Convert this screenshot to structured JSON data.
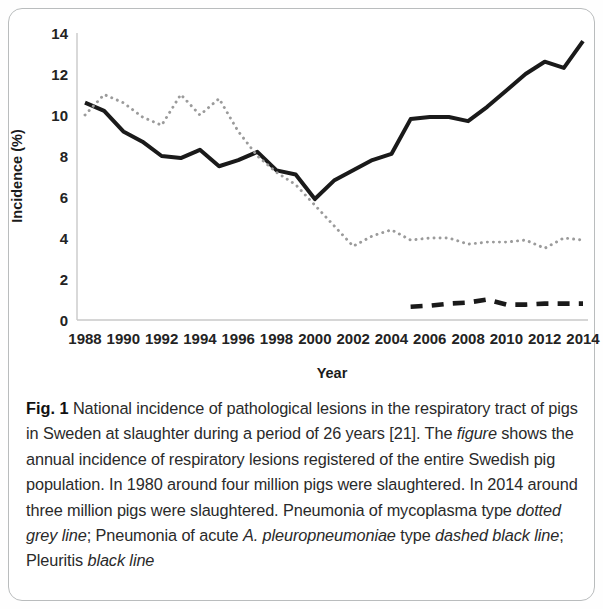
{
  "figure": {
    "label": "Fig. 1",
    "caption_segments": [
      {
        "text": "Fig. 1",
        "style": "bold"
      },
      {
        "text": " National incidence of pathological lesions in the respiratory tract of pigs in Sweden at slaughter during a period of 26 years [21]. The ",
        "style": "normal"
      },
      {
        "text": "figure",
        "style": "italic"
      },
      {
        "text": " shows the annual incidence of respiratory lesions registered of the entire Swedish pig population. In 1980 around four million pigs were slaughtered. In 2014 around three million pigs were slaughtered. Pneumonia of mycoplasma type ",
        "style": "normal"
      },
      {
        "text": "dotted grey line",
        "style": "italic"
      },
      {
        "text": "; Pneumonia of acute ",
        "style": "normal"
      },
      {
        "text": "A. pleuropneumoniae",
        "style": "italic"
      },
      {
        "text": " type ",
        "style": "normal"
      },
      {
        "text": "dashed black line",
        "style": "italic"
      },
      {
        "text": "; Pleuritis ",
        "style": "normal"
      },
      {
        "text": "black line",
        "style": "italic"
      }
    ],
    "caption_plain": "Fig. 1 National incidence of pathological lesions in the respiratory tract of pigs in Sweden at slaughter during a period of 26 years [21]. The figure shows the annual incidence of respiratory lesions registered of the entire Swedish pig population. In 1980 around four million pigs were slaughtered. In 2014 around three million pigs were slaughtered. Pneumonia of mycoplasma type dotted grey line; Pneumonia of acute A. pleuropneumoniae type dashed black line; Pleuritis black line"
  },
  "chart_data": {
    "type": "line",
    "title": "",
    "xlabel": "Year",
    "ylabel": "Incidence (%)",
    "xlim": [
      1988,
      2014
    ],
    "ylim": [
      0,
      14
    ],
    "ytick_labels": [
      "0",
      "2",
      "4",
      "6",
      "8",
      "10",
      "12",
      "14"
    ],
    "yticks": [
      0,
      2,
      4,
      6,
      8,
      10,
      12,
      14
    ],
    "xtick_labels": [
      "1988",
      "1990",
      "1992",
      "1994",
      "1996",
      "1998",
      "2000",
      "2002",
      "2004",
      "2006",
      "2008",
      "2010",
      "2012",
      "2014"
    ],
    "xticks": [
      1988,
      1990,
      1992,
      1994,
      1996,
      1998,
      2000,
      2002,
      2004,
      2006,
      2008,
      2010,
      2012,
      2014
    ],
    "grid": false,
    "legend_position": "none",
    "x": [
      1988,
      1989,
      1990,
      1991,
      1992,
      1993,
      1994,
      1995,
      1996,
      1997,
      1998,
      1999,
      2000,
      2001,
      2002,
      2003,
      2004,
      2005,
      2006,
      2007,
      2008,
      2009,
      2010,
      2011,
      2012,
      2013,
      2014
    ],
    "series": [
      {
        "name": "Pleuritis",
        "style": "solid",
        "color": "#1a1a1a",
        "values": [
          10.6,
          10.2,
          9.2,
          8.7,
          8.0,
          7.9,
          8.3,
          7.5,
          7.8,
          8.2,
          7.3,
          7.1,
          5.9,
          6.8,
          7.3,
          7.8,
          8.1,
          9.8,
          9.9,
          9.9,
          9.7,
          10.4,
          11.2,
          12.0,
          12.6,
          12.3,
          13.6
        ]
      },
      {
        "name": "Pneumonia of mycoplasma type",
        "style": "dotted",
        "color": "#9b9b9b",
        "values": [
          10.0,
          11.0,
          10.6,
          9.9,
          9.5,
          11.0,
          10.0,
          10.8,
          9.2,
          8.0,
          7.2,
          6.6,
          5.6,
          4.6,
          3.6,
          4.1,
          4.4,
          3.9,
          4.0,
          4.0,
          3.7,
          3.8,
          3.8,
          3.9,
          3.5,
          4.0,
          3.9
        ]
      },
      {
        "name": "Pneumonia of acute A. pleuropneumoniae type",
        "style": "dashed",
        "color": "#1a1a1a",
        "values": [
          null,
          null,
          null,
          null,
          null,
          null,
          null,
          null,
          null,
          null,
          null,
          null,
          null,
          null,
          null,
          null,
          null,
          0.65,
          0.7,
          0.8,
          0.85,
          1.0,
          0.75,
          0.75,
          0.8,
          0.8,
          0.8
        ]
      }
    ]
  }
}
